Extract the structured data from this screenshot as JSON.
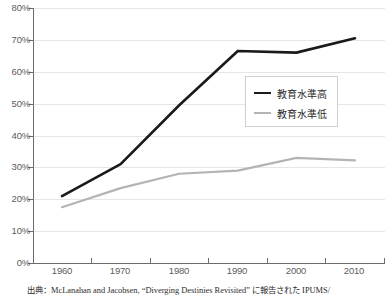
{
  "chart_data": {
    "type": "line",
    "title": "",
    "subtitle": "",
    "xlabel": "",
    "ylabel": "",
    "categories": [
      "1960",
      "1970",
      "1980",
      "1990",
      "2000",
      "2010"
    ],
    "x": [
      1960,
      1970,
      1980,
      1990,
      2000,
      2010
    ],
    "series": [
      {
        "name": "教育水準高",
        "color": "#1a1a1a",
        "values": [
          21,
          31,
          49.5,
          66.5,
          66,
          70.5
        ]
      },
      {
        "name": "教育水準低",
        "color": "#b4b4b4",
        "values": [
          17.5,
          23.5,
          28,
          29,
          33,
          32.2
        ]
      }
    ],
    "ylim": [
      0,
      80
    ],
    "ytick_values": [
      0,
      10,
      20,
      30,
      40,
      50,
      60,
      70,
      80
    ],
    "ytick_labels": [
      "0%",
      "10%",
      "20%",
      "30%",
      "40%",
      "50%",
      "60%",
      "70%",
      "80%"
    ],
    "grid": true,
    "grid_axis": "y",
    "legend_position": "center-right",
    "annotations": []
  },
  "axes": {
    "y_labels": [
      "80%",
      "70%",
      "60%",
      "50%",
      "40%",
      "30%",
      "20%",
      "10%",
      "0%"
    ],
    "x_labels": [
      "1960",
      "1970",
      "1980",
      "1990",
      "2000",
      "2010"
    ]
  },
  "legend": {
    "entries": [
      {
        "label": "教育水準高",
        "swatch": "line-black"
      },
      {
        "label": "教育水準低",
        "swatch": "line-gray"
      }
    ]
  },
  "footer": {
    "source_note": "出典：McLanahan and Jacobsen, “Diverging Destinies Revisited” に報告された IPUMS/"
  },
  "colors": {
    "series_high": "#1a1a1a",
    "series_low": "#b4b4b4",
    "gridline": "#e6e6e6",
    "axis": "#6b6b6b",
    "tick_text": "#5c5c5c",
    "background": "#ffffff"
  }
}
